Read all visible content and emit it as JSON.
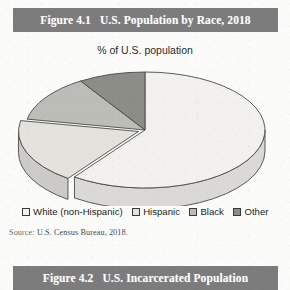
{
  "figures": [
    {
      "label": "Figure 4.1",
      "title": "U.S. Population by Race, 2018",
      "subtitle": "% of U.S. population",
      "source_prefix": "Source:",
      "source_text": "U.S. Census Bureau, 2018."
    },
    {
      "label": "Figure 4.2",
      "title": "U.S. Incarcerated Population"
    }
  ],
  "colors": {
    "header_bar": "#7c7c7c",
    "header_text": "#ffffff",
    "white_slice": "#f2f1ee",
    "hispanic_slice": "#e3e2dd",
    "black_slice": "#bdbdb8",
    "other_slice": "#8d8d88",
    "outline": "#4a4a4a",
    "page_background": "#fbfbf9"
  },
  "chart_data": {
    "type": "pie",
    "title": "U.S. Population by Race, 2018",
    "subtitle": "% of U.S. population",
    "ylabel": "% of U.S. population",
    "xlabel": "",
    "three_d": true,
    "legend_position": "bottom",
    "grid": false,
    "start_angle_deg": 0,
    "direction": "clockwise",
    "categories": [
      "White (non-Hispanic)",
      "Hispanic",
      "Black",
      "Other"
    ],
    "values": [
      60,
      18,
      13,
      9
    ],
    "slices": [
      {
        "label": "White (non-Hispanic)",
        "value": 60,
        "color": "#f2f1ee",
        "exploded": false
      },
      {
        "label": "Hispanic",
        "value": 18,
        "color": "#e3e2dd",
        "exploded": true
      },
      {
        "label": "Black",
        "value": 13,
        "color": "#bdbdb8",
        "exploded": false
      },
      {
        "label": "Other",
        "value": 9,
        "color": "#8d8d88",
        "exploded": false
      }
    ]
  }
}
